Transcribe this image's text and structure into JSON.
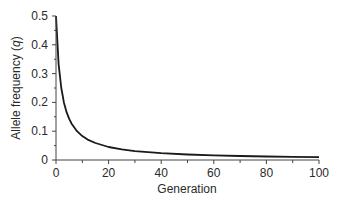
{
  "chart_data": {
    "type": "line",
    "title": "",
    "xlabel": "Generation",
    "ylabel": "Allele frequency (q)",
    "ylabel_prefix": "Allele frequency (",
    "ylabel_var": "q",
    "ylabel_suffix": ")",
    "xlim": [
      0,
      100
    ],
    "ylim": [
      0,
      0.5
    ],
    "x_ticks": [
      0,
      20,
      40,
      60,
      80,
      100
    ],
    "x_tick_labels": [
      "0",
      "20",
      "40",
      "60",
      "80",
      "100"
    ],
    "x_minor_ticks": [
      10,
      30,
      50,
      70,
      90
    ],
    "y_ticks": [
      0,
      0.1,
      0.2,
      0.3,
      0.4,
      0.5
    ],
    "y_tick_labels": [
      "0",
      "0.1",
      "0.2",
      "0.3",
      "0.4",
      "0.5"
    ],
    "y_minor_ticks": [
      0.05,
      0.15,
      0.25,
      0.35,
      0.45
    ],
    "grid": false,
    "legend": null,
    "series": [
      {
        "name": "q",
        "color": "#1a1a1a",
        "x": [
          0,
          1,
          2,
          3,
          4,
          5,
          6,
          8,
          10,
          12,
          15,
          20,
          25,
          30,
          40,
          50,
          60,
          70,
          80,
          90,
          100
        ],
        "values": [
          0.5,
          0.333,
          0.25,
          0.2,
          0.167,
          0.143,
          0.125,
          0.1,
          0.083,
          0.071,
          0.059,
          0.045,
          0.037,
          0.031,
          0.024,
          0.019,
          0.016,
          0.014,
          0.012,
          0.011,
          0.01
        ]
      }
    ]
  }
}
